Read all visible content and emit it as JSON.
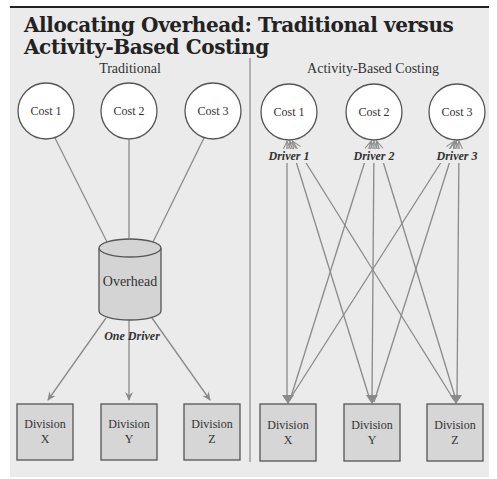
{
  "figure_label": "FIGURE 14.1",
  "title_line1": "Allocating Overhead: Traditional versus",
  "title_line2": "Activity-Based Costing",
  "colors": {
    "panel_bg": "#ebebeb",
    "box_fill": "#d6d6d6",
    "cylinder_fill": "#d4d4d4",
    "line": "#8a8a8a",
    "border": "#555555"
  },
  "traditional": {
    "heading": "Traditional",
    "costs": [
      "Cost 1",
      "Cost 2",
      "Cost 3"
    ],
    "pool_label": "Overhead",
    "driver_label": "One Driver",
    "divisions": [
      {
        "line1": "Division",
        "line2": "X"
      },
      {
        "line1": "Division",
        "line2": "Y"
      },
      {
        "line1": "Division",
        "line2": "Z"
      }
    ]
  },
  "abc": {
    "heading": "Activity-Based Costing",
    "costs": [
      "Cost 1",
      "Cost 2",
      "Cost 3"
    ],
    "drivers": [
      "Driver 1",
      "Driver 2",
      "Driver 3"
    ],
    "divisions": [
      {
        "line1": "Division",
        "line2": "X"
      },
      {
        "line1": "Division",
        "line2": "Y"
      },
      {
        "line1": "Division",
        "line2": "Z"
      }
    ]
  }
}
